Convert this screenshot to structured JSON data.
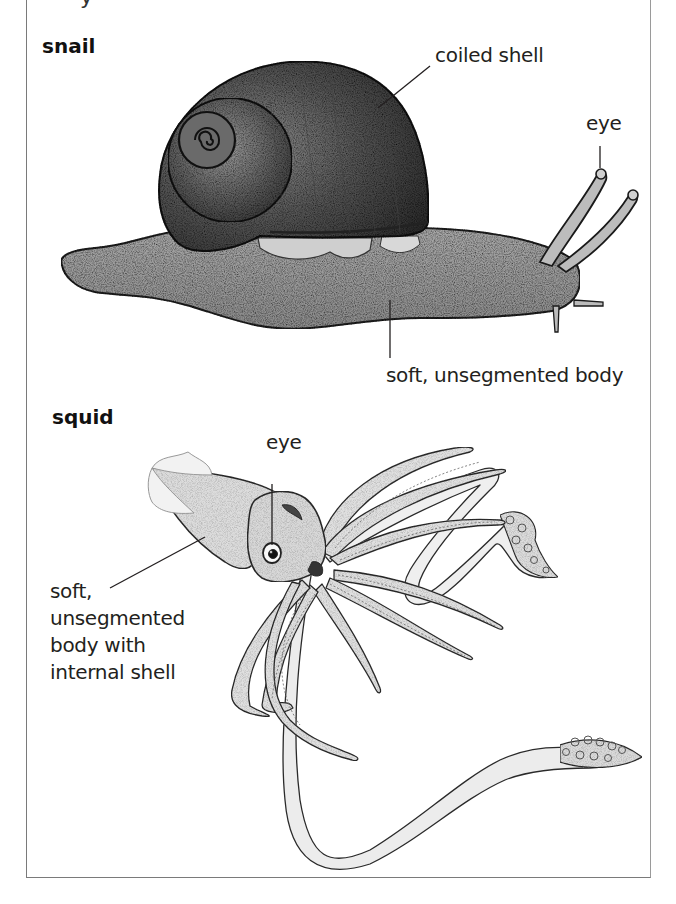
{
  "diagram": {
    "top_cut_text": "y",
    "snail": {
      "title": "snail",
      "labels": {
        "shell": "coiled shell",
        "eye": "eye",
        "body": "soft, unsegmented body"
      }
    },
    "squid": {
      "title": "squid",
      "labels": {
        "eye": "eye",
        "body_line1": "soft,",
        "body_line2": "unsegmented",
        "body_line3": "body with",
        "body_line4": "internal shell"
      }
    },
    "colors": {
      "ink": "#231f20",
      "shell_dark": "#3a3a3a",
      "shell_mid": "#6b6b6b",
      "snail_body": "#9c9c9c",
      "squid_fill": "#e4e4e4",
      "frame": "#7a7a7a"
    }
  }
}
